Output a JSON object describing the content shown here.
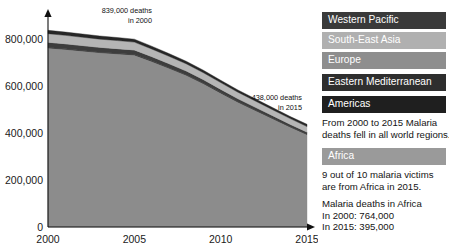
{
  "chart_data": {
    "type": "area",
    "stacked": true,
    "title": "",
    "xlabel": "",
    "ylabel": "",
    "xlim": [
      2000,
      2015
    ],
    "ylim": [
      0,
      900000
    ],
    "grid": false,
    "legend_position": "right",
    "x": [
      2000,
      2001,
      2002,
      2003,
      2004,
      2005,
      2006,
      2007,
      2008,
      2009,
      2010,
      2011,
      2012,
      2013,
      2014,
      2015
    ],
    "y_ticks": [
      0,
      200000,
      400000,
      600000,
      800000
    ],
    "y_tick_labels": [
      "0",
      "200,000",
      "400,000",
      "600,000",
      "800,000"
    ],
    "x_ticks": [
      2000,
      2005,
      2010,
      2015
    ],
    "x_tick_labels": [
      "2000",
      "2005",
      "2010",
      "2015"
    ],
    "series": [
      {
        "name": "Africa",
        "color": "#8c8c8c",
        "values": [
          764000,
          758000,
          751000,
          744000,
          739000,
          734000,
          707000,
          678000,
          648000,
          612000,
          572000,
          533000,
          498000,
          463000,
          428000,
          395000
        ]
      },
      {
        "name": "Americas",
        "color": "#2b2b2b",
        "values": [
          2000,
          2000,
          1900,
          1900,
          1800,
          1800,
          1700,
          1600,
          1500,
          1400,
          1300,
          1200,
          1100,
          1000,
          900,
          800
        ]
      },
      {
        "name": "Eastern Mediterranean",
        "color": "#3d3d3d",
        "values": [
          22000,
          21500,
          21000,
          20500,
          20000,
          19500,
          18500,
          17500,
          16500,
          15500,
          14500,
          13500,
          12500,
          11500,
          10500,
          9500
        ]
      },
      {
        "name": "Europe",
        "color": "#a8a8a8",
        "values": [
          500,
          450,
          420,
          400,
          380,
          350,
          300,
          260,
          220,
          180,
          150,
          120,
          90,
          60,
          40,
          20
        ]
      },
      {
        "name": "South-East Asia",
        "color": "#b5b5b5",
        "values": [
          36000,
          35500,
          35000,
          34500,
          34000,
          33000,
          32000,
          31000,
          30000,
          29000,
          28000,
          27000,
          26000,
          25000,
          24000,
          23000
        ]
      },
      {
        "name": "Western Pacific",
        "color": "#262626",
        "values": [
          14500,
          14000,
          13800,
          13500,
          13000,
          12500,
          12000,
          11500,
          11000,
          10500,
          10000,
          9500,
          9200,
          9000,
          8800,
          9680
        ]
      }
    ],
    "totals": [
      839000,
      831450,
      823120,
      814800,
      808180,
      801150,
      771500,
      739860,
      707220,
      668580,
      625950,
      584320,
      546890,
      509560,
      472240,
      438000
    ],
    "annotations": [
      {
        "name": "start-total",
        "line1": "839,000 deaths",
        "line2": "in 2000",
        "x": 2000,
        "value": 839000
      },
      {
        "name": "end-total",
        "line1": "438,000 deaths",
        "line2": "in 2015",
        "x": 2015,
        "value": 438000
      }
    ]
  },
  "legend": {
    "items": [
      {
        "label": "Western Pacific",
        "color": "#3a3a3a",
        "text_color": "#ffffff"
      },
      {
        "label": "South-East Asia",
        "color": "#b0b0b0",
        "text_color": "#ffffff"
      },
      {
        "label": "Europe",
        "color": "#8e8e8e",
        "text_color": "#ffffff"
      },
      {
        "label": "Eastern Mediterranean",
        "color": "#2e2e2e",
        "text_color": "#ffffff"
      },
      {
        "label": "Americas",
        "color": "#1f1f1f",
        "text_color": "#ffffff"
      },
      {
        "label": "Africa",
        "color": "#9a9a9a",
        "text_color": "#ffffff"
      }
    ]
  },
  "notes": {
    "regions_note_line1": "From 2000 to 2015 Malaria",
    "regions_note_line2": "deaths fell in all world regions.",
    "africa_note_line1": "9 out of 10 malaria victims",
    "africa_note_line2": "are from Africa in 2015.",
    "africa_stats_title": "Malaria deaths in Africa",
    "africa_stats_2000": "In 2000: 764,000",
    "africa_stats_2015": "In 2015: 395,000"
  }
}
